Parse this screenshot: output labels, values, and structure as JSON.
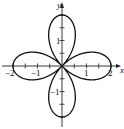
{
  "chart_data": {
    "type": "line",
    "title": "",
    "curve": "four-leaved rose r = 2cos(2θ)",
    "xlabel": "x",
    "ylabel": "y",
    "xlim": [
      -2.4,
      2.5
    ],
    "ylim": [
      -2.1,
      2.7
    ],
    "x_ticks": [
      -2,
      -1,
      1,
      2
    ],
    "x_tick_labels": [
      "−2",
      "−1",
      "1",
      "2"
    ],
    "y_ticks": [
      -1,
      1
    ],
    "y_tick_labels": [
      "−1",
      "1"
    ],
    "minor_tick_step": 0.5,
    "petals": [
      {
        "direction": "+x",
        "tip": [
          2,
          0
        ]
      },
      {
        "direction": "−x",
        "tip": [
          -2,
          0
        ]
      },
      {
        "direction": "+y",
        "tip": [
          0,
          2
        ]
      },
      {
        "direction": "−y",
        "tip": [
          0,
          -2
        ]
      }
    ],
    "grid": false,
    "legend": null
  },
  "labels": {
    "x_axis": "x",
    "y_axis": "y",
    "x_neg2": "−2",
    "x_neg1": "−1",
    "x_pos1": "1",
    "x_pos2": "2",
    "y_pos1": "1",
    "y_neg1": "−1"
  }
}
